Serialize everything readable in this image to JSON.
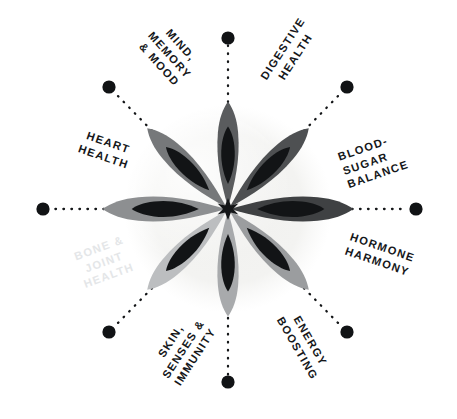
{
  "diagram": {
    "type": "radial-benefits-wheel",
    "title": "",
    "background_color": "#ffffff",
    "center_disc_color": "#f4f4f2",
    "spoke_style": "dotted",
    "spoke_dot_color": "#111315",
    "label_color": "#15171a",
    "faded_label_color": "#e4e6e8",
    "spoke_count": 10,
    "labels": [
      {
        "id": "mind-memory-mood",
        "lines": [
          "MIND,",
          "MEMORY",
          "& MOOD"
        ],
        "text": "MIND, MEMORY & MOOD",
        "angle_deg": -63,
        "rotation_deg": 48,
        "faded": false,
        "align": "center"
      },
      {
        "id": "digestive-health",
        "lines": [
          "DIGESTIVE",
          "HEALTH"
        ],
        "text": "DIGESTIVE HEALTH",
        "angle_deg": -27,
        "rotation_deg": -57,
        "faded": false,
        "align": "center"
      },
      {
        "id": "blood-sugar-balance",
        "lines": [
          "BLOOD-",
          "SUGAR",
          "BALANCE"
        ],
        "text": "BLOOD-SUGAR BALANCE",
        "angle_deg": -20,
        "rotation_deg": -19,
        "faded": false,
        "align": "left"
      },
      {
        "id": "hormone-harmony",
        "lines": [
          "HORMONE",
          "HARMONY"
        ],
        "text": "HORMONE HARMONY",
        "angle_deg": 22,
        "rotation_deg": 19,
        "faded": false,
        "align": "left"
      },
      {
        "id": "energy-boosting",
        "lines": [
          "ENERGY",
          "BOOSTING"
        ],
        "text": "ENERGY BOOSTING",
        "angle_deg": 62,
        "rotation_deg": 60,
        "faded": false,
        "align": "center"
      },
      {
        "id": "skin-senses-immunity",
        "lines": [
          "SKIN,",
          "SENSES &",
          "IMMUNITY"
        ],
        "text": "SKIN, SENSES & IMMUNITY",
        "angle_deg": 118,
        "rotation_deg": -57,
        "faded": false,
        "align": "center"
      },
      {
        "id": "bone-joint-health",
        "lines": [
          "BONE &",
          "JOINT",
          "HEALTH"
        ],
        "text": "BONE & JOINT HEALTH",
        "angle_deg": 160,
        "rotation_deg": -20,
        "faded": true,
        "align": "center"
      },
      {
        "id": "heart-health",
        "lines": [
          "HEART",
          "HEALTH"
        ],
        "text": "HEART HEALTH",
        "angle_deg": -160,
        "rotation_deg": 19,
        "faded": false,
        "align": "center"
      }
    ],
    "flower": {
      "petal_colors": [
        "#4e5052",
        "#6f7173",
        "#8f9193",
        "#a9abad",
        "#c2c4c6",
        "#5c5e60",
        "#7e8082",
        "#b5b7b9"
      ],
      "inner_teardrop_color": "#121416",
      "hub_color": "#141618",
      "petal_count": 8
    }
  }
}
